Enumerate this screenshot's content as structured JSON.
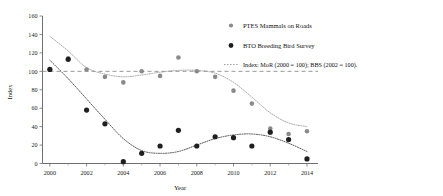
{
  "chart_data": {
    "type": "scatter",
    "title": "",
    "xlabel": "Year",
    "ylabel": "Index",
    "xlim": [
      1999.6,
      2014.6
    ],
    "ylim": [
      0,
      160
    ],
    "xticks": [
      2000,
      2002,
      2004,
      2006,
      2008,
      2010,
      2012,
      2014
    ],
    "xticklabels": [
      "2000",
      "2002",
      "2004",
      "2006",
      "2008",
      "2010",
      "2012",
      "2014"
    ],
    "xminorticks": [
      2001,
      2003,
      2005,
      2007,
      2009,
      2011,
      2013
    ],
    "yticks": [
      0,
      20,
      40,
      60,
      80,
      100,
      120,
      140,
      160
    ],
    "yticklabels": [
      "0",
      "20",
      "40",
      "60",
      "80",
      "100",
      "120",
      "140",
      "160"
    ],
    "grid": false,
    "legend_position": "right",
    "x": [
      2000,
      2001,
      2002,
      2003,
      2004,
      2005,
      2006,
      2007,
      2008,
      2009,
      2010,
      2011,
      2012,
      2013,
      2014
    ],
    "series": [
      {
        "name": "PTES Mammals on Roads",
        "color": "#8a8a8a",
        "marker": "circle",
        "values": [
          102,
          114,
          102,
          94,
          88,
          100,
          95,
          115,
          100,
          94,
          79,
          65,
          38,
          32,
          35
        ],
        "trend": [
          138,
          122,
          104,
          97,
          94,
          96,
          99,
          101,
          101,
          98,
          88,
          72,
          55,
          44,
          40
        ]
      },
      {
        "name": "BTO Breeding Bird Survey",
        "color": "#1f1f1f",
        "marker": "circle",
        "values": [
          102,
          113,
          58,
          43,
          2,
          11,
          19,
          36,
          19,
          29,
          28,
          19,
          34,
          26,
          5
        ],
        "trend": [
          112,
          92,
          70,
          48,
          27,
          14,
          11,
          13,
          20,
          27,
          31,
          32,
          29,
          22,
          13
        ]
      }
    ],
    "reference_line": {
      "label": "baseline",
      "y": 100,
      "style": "dashed",
      "color": "#8a8a8a"
    },
    "annotations": []
  },
  "legend": {
    "items": [
      {
        "marker": "dot-gray",
        "label": "PTES Mammals on Roads"
      },
      {
        "marker": "dot-black",
        "label": "BTO Breeding Bird Survey"
      },
      {
        "marker": "dashed-line",
        "label": "Index: MoR (2000 = 100); BBS (2002 = 100)."
      }
    ]
  }
}
